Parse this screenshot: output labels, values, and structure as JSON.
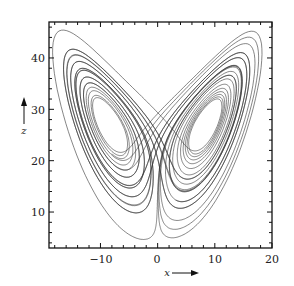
{
  "chart_data": {
    "type": "line",
    "title": "",
    "subtitle": "Lorenz attractor (x–z projection)",
    "xlabel": "x",
    "ylabel": "z",
    "xlim": [
      -19,
      20
    ],
    "ylim": [
      3,
      47
    ],
    "x_ticks": [
      -10,
      0,
      10,
      20
    ],
    "y_ticks": [
      10,
      20,
      30,
      40
    ],
    "x_tick_labels": [
      "−10",
      "0",
      "10",
      "20"
    ],
    "y_tick_labels": [
      "10",
      "20",
      "30",
      "40"
    ],
    "grid": false,
    "legend": null,
    "series": [
      {
        "name": "trajectory",
        "color": "#333333",
        "description": "Lorenz butterfly with two lobes centered near (-8.5, 27) and (8.5, 27); extent x ≈ -17 to 17, z ≈ 5 to 43"
      }
    ]
  },
  "labels": {
    "x_axis": "x",
    "y_axis": "z"
  }
}
